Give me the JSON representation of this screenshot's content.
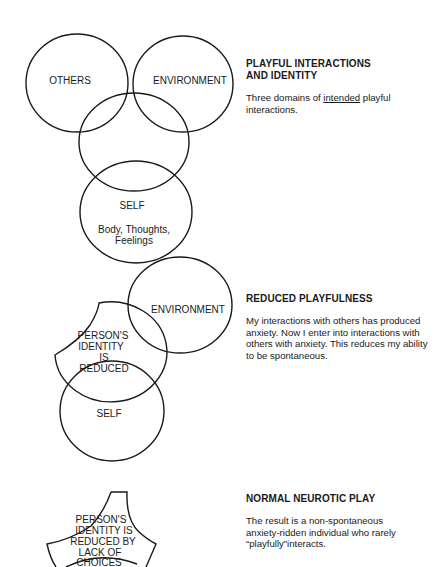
{
  "diagrams": [
    {
      "id": "playful-interactions",
      "labels": {
        "others": "OTHERS",
        "environment": "ENVIRONMENT",
        "self": "SELF",
        "self_sub_1": "Body, Thoughts,",
        "self_sub_2": "Feelings"
      },
      "heading_lines": [
        "PLAYFUL INTERACTIONS",
        "AND IDENTITY"
      ],
      "body_before": "Three domains of ",
      "body_underlined": "intended",
      "body_after": " playful interactions."
    },
    {
      "id": "reduced-playfulness",
      "labels": {
        "environment": "ENVIRONMENT",
        "identity_1": "PERSON'S",
        "identity_2": "IDENTITY",
        "identity_3": "IS",
        "identity_4": "REDUCED",
        "self": "SELF"
      },
      "heading": "REDUCED PLAYFULNESS",
      "body": "My interactions with others has produced anxiety. Now I enter into interactions with others with anxiety. This reduces my ability to be spontaneous."
    },
    {
      "id": "normal-neurotic-play",
      "labels": {
        "identity_1": "PERSON'S",
        "identity_2": "IDENTITY IS",
        "identity_3": "REDUCED BY",
        "identity_4": "LACK OF",
        "identity_5": "CHOICES"
      },
      "heading": "NORMAL NEUROTIC PLAY",
      "body": "The result is a non-spontaneous anxiety-ridden individual who rarely “playfully”interacts."
    }
  ]
}
